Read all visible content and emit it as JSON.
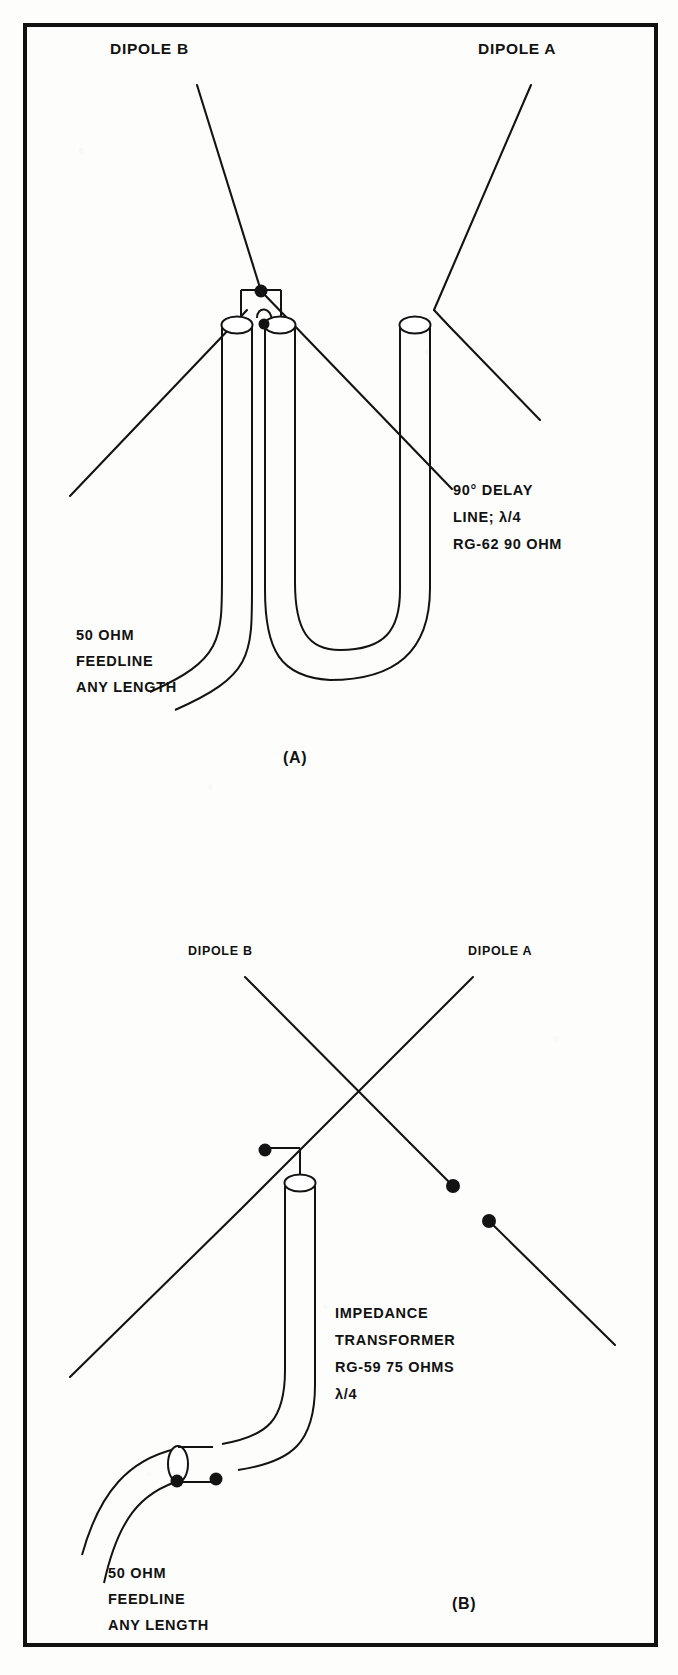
{
  "figure": {
    "background_color": "#fdfdfb",
    "line_color": "#131313",
    "border_color": "#111111"
  },
  "panel_a": {
    "caption": "(A)",
    "dipole_b_label": "DIPOLE B",
    "dipole_a_label": "DIPOLE A",
    "delay_line": {
      "line1": "90° DELAY",
      "line2": "LINE; λ/4",
      "line3": "RG-62  90 OHM"
    },
    "feedline": {
      "line1": "50  OHM",
      "line2": "FEEDLINE",
      "line3": "ANY LENGTH"
    }
  },
  "panel_b": {
    "caption": "(B)",
    "dipole_b_label": "DIPOLE B",
    "dipole_a_label": "DIPOLE A",
    "transformer": {
      "line1": "IMPEDANCE",
      "line2": "TRANSFORMER",
      "line3": "RG-59  75 OHMS",
      "line4": "λ/4"
    },
    "feedline": {
      "line1": "50 OHM",
      "line2": "FEEDLINE",
      "line3": "ANY LENGTH"
    }
  }
}
